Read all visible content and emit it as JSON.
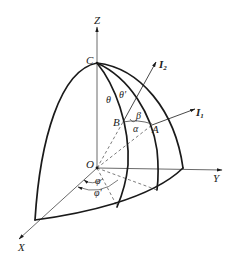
{
  "diagram": {
    "axes": {
      "x_label": "X",
      "y_label": "Y",
      "z_label": "Z",
      "origin_label": "O"
    },
    "points": {
      "apex": "C",
      "point_a": "A",
      "point_b": "B"
    },
    "vectors": {
      "i1_label": "I",
      "i1_sub": "1",
      "i2_label": "I",
      "i2_sub": "2"
    },
    "angles": {
      "theta": "θ",
      "theta_prime": "θ'",
      "alpha": "α",
      "beta": "β",
      "phi": "φ",
      "phi_prime": "φ'"
    },
    "colors": {
      "stroke": "#1a1a1a",
      "thin_stroke": "#444444",
      "background": "#ffffff"
    }
  }
}
